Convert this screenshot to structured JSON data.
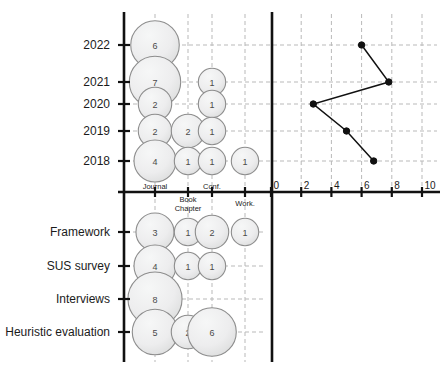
{
  "chart_data": {
    "type": "bar",
    "title": "",
    "subtitle": "",
    "panels": [
      {
        "name": "publications-by-year-and-type",
        "type": "bubble",
        "xlabel": "",
        "ylabel": "",
        "categories": [
          "Journal",
          "Book Chapter",
          "Conf.",
          "Work."
        ],
        "rows": [
          "2022",
          "2021",
          "2020",
          "2019",
          "2018"
        ],
        "grid": true,
        "bubbles": [
          {
            "row": "2022",
            "category": "Journal",
            "value": 6
          },
          {
            "row": "2021",
            "category": "Journal",
            "value": 7
          },
          {
            "row": "2021",
            "category": "Conf.",
            "value": 1
          },
          {
            "row": "2020",
            "category": "Journal",
            "value": 2
          },
          {
            "row": "2020",
            "category": "Conf.",
            "value": 1
          },
          {
            "row": "2019",
            "category": "Journal",
            "value": 2
          },
          {
            "row": "2019",
            "category": "Book Chapter",
            "value": 2
          },
          {
            "row": "2019",
            "category": "Conf.",
            "value": 1
          },
          {
            "row": "2018",
            "category": "Journal",
            "value": 4
          },
          {
            "row": "2018",
            "category": "Book Chapter",
            "value": 1
          },
          {
            "row": "2018",
            "category": "Conf.",
            "value": 1
          },
          {
            "row": "2018",
            "category": "Work.",
            "value": 1
          }
        ]
      },
      {
        "name": "publications-per-year-line",
        "type": "line",
        "xlabel": "",
        "ylabel": "",
        "xlim": [
          0,
          10
        ],
        "xticks": [
          0,
          2,
          4,
          6,
          8,
          10
        ],
        "grid": true,
        "categories": [
          "2022",
          "2021",
          "2020",
          "2019",
          "2018"
        ],
        "values": [
          6,
          7.8,
          2.8,
          5,
          6.8
        ]
      },
      {
        "name": "methods-by-publication-type",
        "type": "bubble",
        "xlabel": "",
        "ylabel": "",
        "categories": [
          "Journal",
          "Book Chapter",
          "Conf.",
          "Work."
        ],
        "rows": [
          "Framework",
          "SUS survey",
          "Interviews",
          "Heuristic evaluation"
        ],
        "grid": true,
        "bubbles": [
          {
            "row": "Framework",
            "category": "Journal",
            "value": 3
          },
          {
            "row": "Framework",
            "category": "Book Chapter",
            "value": 1
          },
          {
            "row": "Framework",
            "category": "Conf.",
            "value": 2
          },
          {
            "row": "Framework",
            "category": "Work.",
            "value": 1
          },
          {
            "row": "SUS survey",
            "category": "Journal",
            "value": 4
          },
          {
            "row": "SUS survey",
            "category": "Book Chapter",
            "value": 1
          },
          {
            "row": "SUS survey",
            "category": "Conf.",
            "value": 1
          },
          {
            "row": "Interviews",
            "category": "Journal",
            "value": 8
          },
          {
            "row": "Heuristic evaluation",
            "category": "Journal",
            "value": 5
          },
          {
            "row": "Heuristic evaluation",
            "category": "Book Chapter",
            "value": 2
          },
          {
            "row": "Heuristic evaluation",
            "category": "Conf.",
            "value": 6
          }
        ]
      }
    ],
    "colors": {
      "bubble_fill": "#eceded",
      "bubble_stroke": "#8d8d8d",
      "axis": "#111111",
      "grid": "#b9b9b9",
      "line": "#111111",
      "marker": "#111111",
      "text": "#1b1b1b"
    }
  },
  "axes": {
    "category_labels": [
      "Journal",
      "Book Chapter",
      "Conf.",
      "Work."
    ],
    "year_labels": [
      "2022",
      "2021",
      "2020",
      "2019",
      "2018"
    ],
    "method_labels": [
      "Framework",
      "SUS survey",
      "Interviews",
      "Heuristic evaluation"
    ],
    "numeric_ticks": [
      "0",
      "2",
      "4",
      "6",
      "8",
      "10"
    ]
  }
}
